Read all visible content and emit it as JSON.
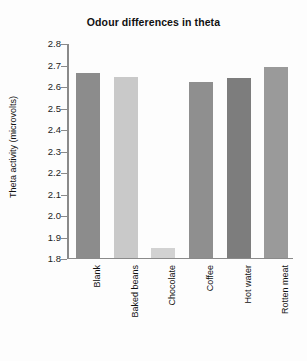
{
  "chart_data": {
    "type": "bar",
    "title": "Odour differences in theta",
    "xlabel": "",
    "ylabel": "Theta activity (microvolts)",
    "categories": [
      "Blank",
      "Baked beans",
      "Chocolate",
      "Coffee",
      "Hot water",
      "Rotten meat"
    ],
    "values": [
      2.665,
      2.645,
      1.85,
      2.625,
      2.64,
      2.695
    ],
    "bar_colors": [
      "#8c8c8c",
      "#c9c9c9",
      "#d2d2d2",
      "#8f8f8f",
      "#7d7d7d",
      "#9a9a9a"
    ],
    "ylim": [
      1.8,
      2.8
    ],
    "yticks": [
      "2.8",
      "2.7",
      "2.6",
      "2.5",
      "2.4",
      "2.3",
      "2.2",
      "2.1",
      "2.0",
      "1.9",
      "1.8"
    ],
    "ytick_values": [
      2.8,
      2.7,
      2.6,
      2.5,
      2.4,
      2.3,
      2.2,
      2.1,
      2.0,
      1.9,
      1.8
    ],
    "grid": false,
    "legend": false,
    "axis_color": "#8a8a8a",
    "text_color": "#111111",
    "background": "#fdfdfd"
  }
}
